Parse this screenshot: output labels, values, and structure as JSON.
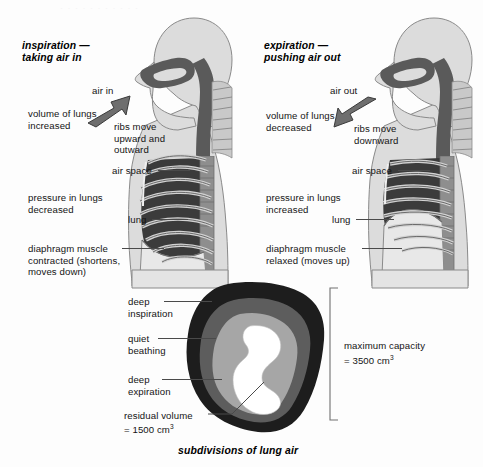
{
  "figure": {
    "caption": "subdivisions of lung air"
  },
  "panels": [
    {
      "id": "inspiration",
      "heading": "inspiration —\ntaking air in",
      "airflow_label": "air in",
      "airflow_direction": "in",
      "labels": [
        {
          "name": "volume-of-lungs",
          "text": "volume of lungs\nincreased"
        },
        {
          "name": "ribs-move",
          "text": "ribs move\nupward and\noutward"
        },
        {
          "name": "air-space",
          "text": "air space"
        },
        {
          "name": "pressure-in-lungs",
          "text": "pressure in lungs\ndecreased"
        },
        {
          "name": "lung",
          "text": "lung"
        },
        {
          "name": "diaphragm-muscle",
          "text": "diaphragm muscle\ncontracted (shortens,\nmoves down)"
        }
      ]
    },
    {
      "id": "expiration",
      "heading": "expiration —\npushing air out",
      "airflow_label": "air out",
      "airflow_direction": "out",
      "labels": [
        {
          "name": "volume-of-lungs",
          "text": "volume of lungs\ndecreased"
        },
        {
          "name": "ribs-move",
          "text": "ribs move\ndownward"
        },
        {
          "name": "air-space",
          "text": "air space"
        },
        {
          "name": "pressure-in-lungs",
          "text": "pressure in lungs\nincreased"
        },
        {
          "name": "lung",
          "text": "lung"
        },
        {
          "name": "diaphragm-muscle",
          "text": "diaphragm muscle\nrelaxed (moves up)"
        }
      ]
    }
  ],
  "lung_air": {
    "layers": [
      {
        "name": "deep-inspiration",
        "label": "deep\ninspiration",
        "color": "#1d1d1d"
      },
      {
        "name": "quiet-breathing",
        "label": "quiet\nbeathing",
        "color": "#5d5d5d"
      },
      {
        "name": "deep-expiration",
        "label": "deep\nexpiration",
        "color": "#a6a6a6"
      },
      {
        "name": "residual-volume",
        "label": "residual volume",
        "color": "#ffffff"
      }
    ],
    "residual_value_line1": "residual volume",
    "residual_value_line2": "= 1500 cm",
    "residual_value_sup": "3",
    "capacity_line1": "maximum capacity",
    "capacity_line2": "= 3500 cm",
    "capacity_sup": "3"
  },
  "colors": {
    "body_fill": "#dcdcdc",
    "body_outline": "#6e6e6e",
    "airway_dark": "#5a5a5a",
    "rib_light": "#cfcfcf",
    "lung_dark": "#3b3b3b",
    "leader": "#4a4a4a",
    "text": "#141414"
  }
}
